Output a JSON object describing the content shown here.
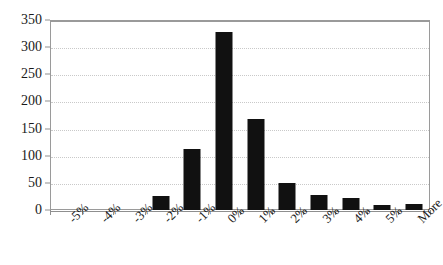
{
  "chart_data": {
    "type": "bar",
    "title": "",
    "subtitle": "",
    "xlabel": "",
    "ylabel": "",
    "categories": [
      "-5%",
      "-4%",
      "-3%",
      "-2%",
      "-1%",
      "0%",
      "1%",
      "2%",
      "3%",
      "4%",
      "5%",
      "More"
    ],
    "values": [
      0,
      0,
      0,
      25,
      112,
      328,
      167,
      50,
      27,
      22,
      9,
      11
    ],
    "series": [
      {
        "name": "Frequency",
        "values": [
          0,
          0,
          0,
          25,
          112,
          328,
          167,
          50,
          27,
          22,
          9,
          11
        ]
      }
    ],
    "ylim": [
      0,
      350
    ],
    "ytick_labels": [
      "0",
      "50",
      "100",
      "150",
      "200",
      "250",
      "300",
      "350"
    ],
    "ytick_values": [
      0,
      50,
      100,
      150,
      200,
      250,
      300,
      350
    ],
    "grid": true,
    "grid_axis": "y",
    "legend": false,
    "legend_position": "none",
    "bar_color": "#111111",
    "grid_color": "#c9c9c9",
    "axis_color": "#8f8f8f",
    "background_color": "#ffffff",
    "xtick_label_rotation": -45
  }
}
